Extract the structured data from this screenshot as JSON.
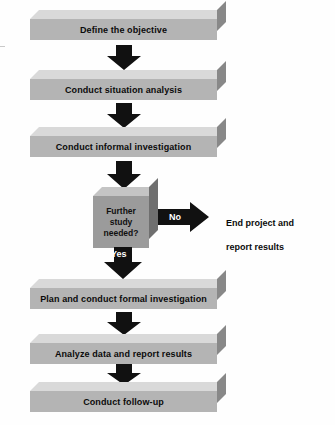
{
  "diagram": {
    "type": "flowchart",
    "orientation": "vertical",
    "colors": {
      "box_front": "#b4b4b4",
      "box_top": "#d9d9d9",
      "box_side": "#888888",
      "decision_front": "#9b9b9b",
      "decision_top": "#c4c4c4",
      "decision_side": "#6f6f6f",
      "arrow": "#111111",
      "text": "#0b0b0b",
      "arrow_text": "#ffffff",
      "background": "#ffffff"
    },
    "nodes": [
      {
        "id": "n1",
        "shape": "process",
        "label": "Define the objective"
      },
      {
        "id": "n2",
        "shape": "process",
        "label": "Conduct situation analysis"
      },
      {
        "id": "n3",
        "shape": "process",
        "label": "Conduct informal investigation"
      },
      {
        "id": "n4",
        "shape": "decision",
        "label_lines": [
          "Further",
          "study",
          "needed?"
        ]
      },
      {
        "id": "n5",
        "shape": "terminal-text",
        "label_lines": [
          "End project and",
          "report results"
        ]
      },
      {
        "id": "n6",
        "shape": "process",
        "label": "Plan and conduct formal investigation"
      },
      {
        "id": "n7",
        "shape": "process",
        "label": "Analyze data and report results"
      },
      {
        "id": "n8",
        "shape": "process",
        "label": "Conduct follow-up"
      }
    ],
    "edges": [
      {
        "from": "n1",
        "to": "n2",
        "label": "",
        "direction": "down"
      },
      {
        "from": "n2",
        "to": "n3",
        "label": "",
        "direction": "down"
      },
      {
        "from": "n3",
        "to": "n4",
        "label": "",
        "direction": "down"
      },
      {
        "from": "n4",
        "to": "n5",
        "label": "No",
        "direction": "right"
      },
      {
        "from": "n4",
        "to": "n6",
        "label": "Yes",
        "direction": "down"
      },
      {
        "from": "n6",
        "to": "n7",
        "label": "",
        "direction": "down"
      },
      {
        "from": "n7",
        "to": "n8",
        "label": "",
        "direction": "down"
      }
    ]
  }
}
